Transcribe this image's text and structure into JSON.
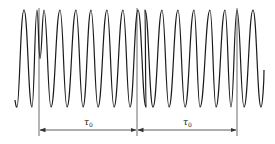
{
  "diagram": {
    "title": "",
    "background": "#ffffff",
    "stroke_color": "#1a1a1a",
    "marker_color": "#444444",
    "waveform": {
      "top_y": 10,
      "bottom_y": 107,
      "start": {
        "x": 16,
        "y": 100
      },
      "extrema": [
        {
          "x": 16,
          "type": "trough"
        },
        {
          "x": 24,
          "type": "peak"
        },
        {
          "x": 32,
          "type": "trough"
        },
        {
          "x": 37,
          "type": "peak"
        },
        {
          "x": 40,
          "type": "mid"
        },
        {
          "x": 44,
          "type": "peak"
        },
        {
          "x": 51,
          "type": "trough"
        },
        {
          "x": 60,
          "type": "peak"
        },
        {
          "x": 67,
          "type": "trough"
        },
        {
          "x": 76,
          "type": "peak"
        },
        {
          "x": 83,
          "type": "trough"
        },
        {
          "x": 91,
          "type": "peak"
        },
        {
          "x": 98,
          "type": "trough"
        },
        {
          "x": 107,
          "type": "peak"
        },
        {
          "x": 114,
          "type": "trough"
        },
        {
          "x": 123,
          "type": "peak"
        },
        {
          "x": 130,
          "type": "trough"
        },
        {
          "x": 138,
          "type": "peak"
        },
        {
          "x": 146,
          "type": "trough"
        },
        {
          "x": 146,
          "type": "skip"
        },
        {
          "x": 145,
          "type": "peak"
        },
        {
          "x": 153,
          "type": "trough"
        },
        {
          "x": 162,
          "type": "peak"
        },
        {
          "x": 169,
          "type": "trough"
        },
        {
          "x": 178,
          "type": "peak"
        },
        {
          "x": 185,
          "type": "trough"
        },
        {
          "x": 194,
          "type": "peak"
        },
        {
          "x": 200,
          "type": "trough"
        },
        {
          "x": 210,
          "type": "peak"
        },
        {
          "x": 216,
          "type": "trough"
        },
        {
          "x": 225,
          "type": "peak"
        },
        {
          "x": 231,
          "type": "trough"
        },
        {
          "x": 237,
          "type": "peak"
        },
        {
          "x": 244,
          "type": "trough"
        },
        {
          "x": 253,
          "type": "peak"
        },
        {
          "x": 261,
          "type": "trough"
        }
      ],
      "end": {
        "x": 264,
        "y": 70
      }
    },
    "markers": {
      "vertical_lines_x": [
        39,
        137,
        237
      ],
      "line_top_y": 8,
      "line_bottom_y": 136,
      "arrow_y": 130
    },
    "intervals": [
      {
        "label": "τ",
        "subscript": "0",
        "from_x": 39,
        "to_x": 137,
        "label_x": 84,
        "label_y": 118
      },
      {
        "label": "τ",
        "subscript": "0",
        "from_x": 137,
        "to_x": 237,
        "label_x": 183,
        "label_y": 118
      }
    ]
  }
}
